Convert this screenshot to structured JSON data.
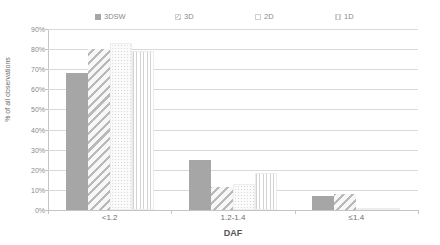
{
  "chart_data": {
    "type": "bar",
    "title": "",
    "xlabel": "DAF",
    "ylabel": "% of all observations",
    "categories": [
      "<1.2",
      "1.2-1.4",
      "≤1.4"
    ],
    "ylim": [
      0,
      90
    ],
    "ytick_labels": [
      "0%",
      "10%",
      "20%",
      "30%",
      "40%",
      "50%",
      "60%",
      "70%",
      "80%",
      "90%"
    ],
    "ytick_values": [
      0,
      10,
      20,
      30,
      40,
      50,
      60,
      70,
      80,
      90
    ],
    "grid": true,
    "legend_position": "top",
    "series": [
      {
        "name": "3DSW",
        "pattern": "solid",
        "values": [
          68,
          25,
          7
        ]
      },
      {
        "name": "3D",
        "pattern": "diagonal",
        "values": [
          80,
          11.5,
          8
        ]
      },
      {
        "name": "2D",
        "pattern": "dotted",
        "values": [
          83,
          13,
          0.4
        ]
      },
      {
        "name": "1D",
        "pattern": "vertical",
        "values": [
          79,
          18.5,
          0.4
        ]
      }
    ]
  },
  "legend": {
    "items": [
      {
        "label": "3DSW"
      },
      {
        "label": "3D"
      },
      {
        "label": "2D"
      },
      {
        "label": "1D"
      }
    ]
  },
  "axes": {
    "y_title": "% of all observations",
    "x_title": "DAF"
  },
  "colors": {
    "solid_bar": "#a6a6a6",
    "pattern_line": "#bdbdbd",
    "gridline": "#d9d9d9",
    "axis": "#c4c4c4",
    "text": "#6e6e6e",
    "background": "#ffffff"
  }
}
